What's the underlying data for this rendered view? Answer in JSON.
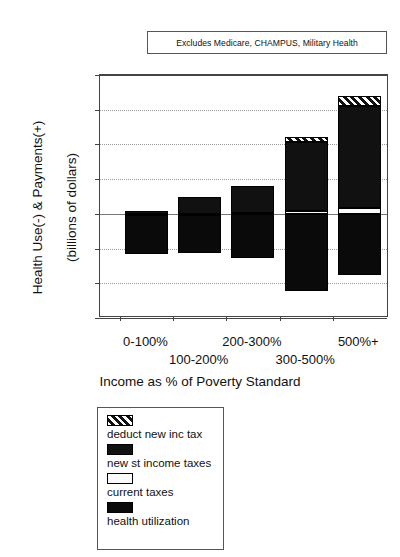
{
  "top_clipped_text": "",
  "callout": {
    "text": "Excludes Medicare, CHAMPUS, Military Health"
  },
  "axis_titles": {
    "y_line1": "Health Use(-) & Payments(+)",
    "y_line2": "(billions of dollars)",
    "x": "Income as % of Poverty Standard"
  },
  "chart_data": {
    "type": "bar",
    "title": "",
    "subtitle": "Excludes Medicare, CHAMPUS, Military Health",
    "stacked": true,
    "xlabel": "Income as % of Poverty Standard",
    "ylabel": "Health Use(-) & Payments(+) (billions of dollars)",
    "ylim": [
      -6.0,
      8.0
    ],
    "ytick_values": [
      8.0,
      6.0,
      4.0,
      2.0,
      0.0,
      -2.0,
      -4.0,
      -6.0
    ],
    "ytick_labels": [
      "$8.0",
      "$6.0",
      "$4.0",
      "$2.0",
      "$0.0",
      "($2.0)",
      "($4.0)",
      "($6.0)"
    ],
    "grid": true,
    "legend_position": "below-plot",
    "categories": [
      "0-100%",
      "100-200%",
      "200-300%",
      "300-500%",
      "500%+"
    ],
    "series": [
      {
        "name": "deduct new inc tax",
        "pattern": "diagonal-hatch",
        "values": [
          0.0,
          0.0,
          0.0,
          0.25,
          0.6
        ]
      },
      {
        "name": "new st income taxes",
        "pattern": "brick",
        "values": [
          0.15,
          0.95,
          1.55,
          4.0,
          5.85
        ]
      },
      {
        "name": "current taxes",
        "pattern": "dotted",
        "values": [
          0.02,
          0.02,
          0.05,
          0.15,
          0.35
        ]
      },
      {
        "name": "health utilization",
        "pattern": "solid-black",
        "values": [
          -2.3,
          -2.25,
          -2.55,
          -4.45,
          -3.5
        ]
      }
    ]
  },
  "legend": {
    "items": [
      {
        "label": "deduct new inc tax",
        "pattern": "diagonal-hatch"
      },
      {
        "label": "new st income taxes",
        "pattern": "brick"
      },
      {
        "label": "current taxes",
        "pattern": "dotted"
      },
      {
        "label": "health utilization",
        "pattern": "solid-black"
      }
    ]
  }
}
